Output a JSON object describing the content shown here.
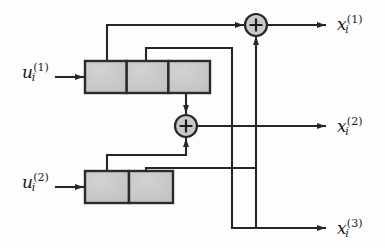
{
  "figure": {
    "type": "block-diagram",
    "background_color": "#fdfdfd",
    "line_color": "#262626",
    "register_fill": "#c8c8c8",
    "register_stroke": "#2b2b2b",
    "adder_fill": "#c9c9c9"
  },
  "inputs": [
    {
      "id": "input-1",
      "base": "u",
      "subscript": "i",
      "superscript": "(1)",
      "label": "u_i^(1)",
      "x": 22,
      "y": 62
    },
    {
      "id": "input-2",
      "base": "u",
      "subscript": "i",
      "superscript": "(2)",
      "label": "u_i^(2)",
      "x": 22,
      "y": 172
    }
  ],
  "outputs": [
    {
      "id": "output-1",
      "base": "x",
      "subscript": "i",
      "superscript": "(1)",
      "label": "x_i^(1)",
      "x": 337,
      "y": 14
    },
    {
      "id": "output-2",
      "base": "x",
      "subscript": "i",
      "superscript": "(2)",
      "label": "x_i^(2)",
      "x": 337,
      "y": 116
    },
    {
      "id": "output-3",
      "base": "x",
      "subscript": "i",
      "superscript": "(3)",
      "label": "x_i^(3)",
      "x": 337,
      "y": 218
    }
  ],
  "registers": [
    {
      "id": "shift-register-1",
      "name": "upper-shift-register",
      "stages": 3,
      "x": 85,
      "y": 61,
      "width": 125,
      "height": 32,
      "cell_width": 41.67
    },
    {
      "id": "shift-register-2",
      "name": "lower-shift-register",
      "stages": 2,
      "x": 85,
      "y": 171,
      "width": 88,
      "height": 32,
      "cell_width": 44
    }
  ],
  "adders": [
    {
      "id": "adder-top",
      "symbol": "+",
      "cx": 256,
      "cy": 24,
      "r": 11
    },
    {
      "id": "adder-middle",
      "symbol": "+",
      "cx": 186,
      "cy": 126,
      "r": 11
    }
  ]
}
